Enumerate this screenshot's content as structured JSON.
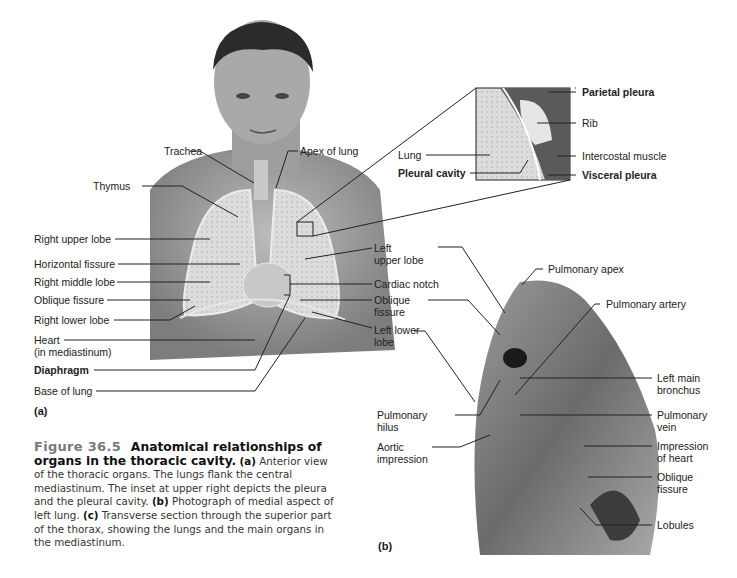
{
  "figure": {
    "number": "Figure 36.5",
    "title": "Anatomical relationships of organs in the thoracic cavity.",
    "caption_parts": [
      {
        "tag": "(a)",
        "text": " Anterior view of the thoracic organs. The lungs flank the central mediastinum. The inset at upper right depicts the pleura and the pleural cavity. "
      },
      {
        "tag": "(b)",
        "text": " Photograph of medial aspect of left lung. "
      },
      {
        "tag": "(c)",
        "text": " Transverse section through the superior part of the thorax, showing the lungs and the main organs in the mediastinum."
      }
    ]
  },
  "panel_a": {
    "tag": "(a)",
    "left_labels": [
      "Thymus",
      "Right upper lobe",
      "Horizontal fissure",
      "Right middle lobe",
      "Oblique fissure",
      "Right lower lobe",
      "Heart",
      "(in mediastinum)",
      "Diaphragm",
      "Base of lung"
    ],
    "top_labels": [
      "Trachea",
      "Apex of lung"
    ],
    "right_labels": [
      "Left",
      "upper lobe",
      "Cardiac notch",
      "Oblique",
      "fissure",
      "Left lower",
      "lobe"
    ]
  },
  "inset": {
    "left_labels": [
      "Lung",
      "Pleural cavity"
    ],
    "right_labels": [
      "Parietal pleura",
      "Rib",
      "Intercostal muscle",
      "Visceral pleura"
    ]
  },
  "panel_b": {
    "tag": "(b)",
    "labels": {
      "pulmonary_apex": "Pulmonary apex",
      "pulmonary_artery": "Pulmonary artery",
      "left_main_bronchus": [
        "Left main",
        "bronchus"
      ],
      "pulmonary_vein": [
        "Pulmonary",
        "vein"
      ],
      "impression_of_heart": [
        "Impression",
        "of heart"
      ],
      "oblique_fissure": [
        "Oblique",
        "fissure"
      ],
      "lobules": "Lobules",
      "pulmonary_hilus": [
        "Pulmonary",
        "hilus"
      ],
      "aortic_impression": [
        "Aortic",
        "impression"
      ]
    }
  }
}
